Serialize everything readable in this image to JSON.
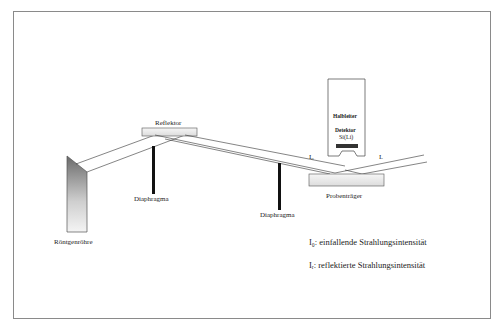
{
  "diagram": {
    "type": "TXRF schematic (Totalreflexions-Röntgenfluoreszenz)",
    "components": {
      "tube": "Röntgenröhre",
      "reflector": "Reflektor",
      "diaphragm1": "Diaphragma",
      "diaphragm2": "Diaphragma",
      "sample_holder": "Probenträger",
      "detector_line1": "Halbleiter",
      "detector_line2": "Detektor",
      "detector_line3": "Si(Li)"
    },
    "beam_labels": {
      "incident": "I₀",
      "reflected": "Iᵣ"
    },
    "legend": [
      {
        "symbol": "I₀",
        "text": ": einfallende Strahlungsintensität"
      },
      {
        "symbol": "Iᵣ",
        "text": ": reflektierte Strahlungsintensität"
      }
    ]
  }
}
